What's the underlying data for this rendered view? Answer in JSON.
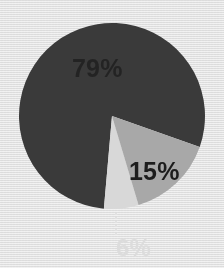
{
  "figure": {
    "name": "pie-chart-figure",
    "background_color": "#f2f2f2",
    "texture": "woven-canvas"
  },
  "chart_data": {
    "type": "pie",
    "title": "",
    "subtitle": "",
    "xlabel": "",
    "ylabel": "",
    "grid": false,
    "legend": "none",
    "labels_shown_as": "percent",
    "categories": [
      "79%",
      "15%",
      "6%"
    ],
    "values": [
      79,
      15,
      6
    ],
    "units": "percent",
    "total": 100,
    "start_angle_deg": 185,
    "direction": "clockwise",
    "center": {
      "x": 112,
      "y": 116
    },
    "radius": 93,
    "slices": [
      {
        "label": "79%",
        "value": 79,
        "color": "#3a3a3a",
        "sweep_deg": 284.4,
        "label_color": "#232323",
        "label_position": "inside",
        "leader_line": false
      },
      {
        "label": "15%",
        "value": 15,
        "color": "#a8a8a8",
        "sweep_deg": 54.0,
        "label_color": "#1d1d1d",
        "label_position": "inside",
        "leader_line": false
      },
      {
        "label": "6%",
        "value": 6,
        "color": "#d8d8d8",
        "sweep_deg": 21.6,
        "label_color": "#dcdcdc",
        "label_position": "outside-below",
        "leader_line": true
      }
    ]
  },
  "labels": {
    "large_slice": "79%",
    "medium_slice": "15%",
    "small_slice": "6%"
  },
  "colors": {
    "slice_dark": "#3a3a3a",
    "slice_mid": "#a8a8a8",
    "slice_light": "#d8d8d8",
    "background": "#f2f2f2",
    "leader_line": "#e2e2e2"
  }
}
